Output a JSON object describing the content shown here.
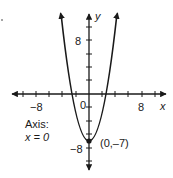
{
  "diagram": {
    "title": "",
    "function": "y = x^2 - 7",
    "x_axis": {
      "label": "x",
      "tick_labels": [
        "-8",
        "8"
      ],
      "origin_label": "0",
      "tick_step": 2
    },
    "y_axis": {
      "label": "y",
      "tick_labels": [
        "8",
        "-8"
      ],
      "tick_step": 2
    },
    "vertex": {
      "label": "(0,–7)",
      "x": 0,
      "y": -7
    },
    "axis_of_symmetry": {
      "line1": "Axis:",
      "line2": "x = 0"
    },
    "colors": {
      "ink": "#1a1a1a",
      "background": "#ffffff"
    }
  },
  "labels": {
    "x_neg8": "−8",
    "x_pos8": "8",
    "origin": "0",
    "x_name": "x",
    "y_name": "y",
    "y_pos8": "8",
    "y_neg8": "−8",
    "vertex": "(0,–7)",
    "axis_line1": "Axis:",
    "axis_line2": "x = 0"
  }
}
